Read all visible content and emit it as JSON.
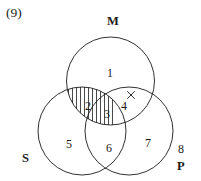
{
  "figure": {
    "item_number": "(9)",
    "set_labels": [
      {
        "name": "M",
        "text": "M",
        "x": 107,
        "y": 15
      },
      {
        "name": "S",
        "text": "S",
        "x": 22,
        "y": 152
      },
      {
        "name": "P",
        "text": "P",
        "x": 177,
        "y": 160
      }
    ],
    "region_labels": [
      {
        "name": "region-1",
        "text": "1",
        "x": 107,
        "y": 67
      },
      {
        "name": "region-2",
        "text": "2",
        "x": 85,
        "y": 100
      },
      {
        "name": "region-3",
        "text": "3",
        "x": 104,
        "y": 108
      },
      {
        "name": "region-4",
        "text": "4",
        "x": 121,
        "y": 100
      },
      {
        "name": "region-5",
        "text": "5",
        "x": 66,
        "y": 138
      },
      {
        "name": "region-6",
        "text": "6",
        "x": 106,
        "y": 142
      },
      {
        "name": "region-7",
        "text": "7",
        "x": 145,
        "y": 137
      },
      {
        "name": "region-8",
        "text": "8",
        "x": 178,
        "y": 143
      }
    ],
    "circles": [
      {
        "name": "circle-M",
        "cx": 110.5,
        "cy": 81,
        "r": 44
      },
      {
        "name": "circle-S",
        "cx": 82,
        "cy": 131,
        "r": 44
      },
      {
        "name": "circle-P",
        "cx": 129,
        "cy": 131,
        "r": 44
      }
    ],
    "marks": {
      "x_mark": {
        "name": "x-mark",
        "cx": 131,
        "cy": 95,
        "size": 7
      },
      "shading": {
        "name": "vertical-hatching",
        "orientation": "vertical",
        "line_count": 11,
        "spacing": 4
      }
    },
    "colors": {
      "ink": "#1a1a1a",
      "background": "#ffffff"
    }
  }
}
